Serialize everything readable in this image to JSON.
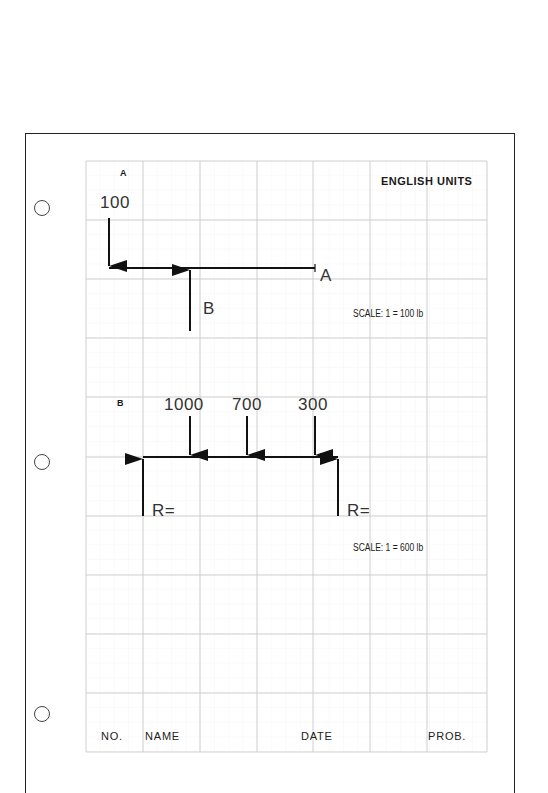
{
  "sheet": {
    "header": "ENGLISH UNITS",
    "grid": {
      "columns": 7,
      "rows": 10,
      "left": 86,
      "top": 161,
      "col_width": 57.3,
      "row_height": 59.1
    },
    "colors": {
      "ink": "#1a1a1a",
      "grid_major": "#c8c8c8",
      "grid_minor": "#ececec"
    }
  },
  "problem_a": {
    "label": "A",
    "load": "100",
    "end_label": "A",
    "reaction_label": "B",
    "scale": "SCALE: 1 = 100 lb"
  },
  "problem_b": {
    "label": "B",
    "loads": [
      "1000",
      "700",
      "300"
    ],
    "reaction_left": "R=",
    "reaction_right": "R=",
    "scale": "SCALE: 1 = 600 lb"
  },
  "footer": {
    "no": "NO.",
    "name": "NAME",
    "date": "DATE",
    "prob": "PROB."
  }
}
